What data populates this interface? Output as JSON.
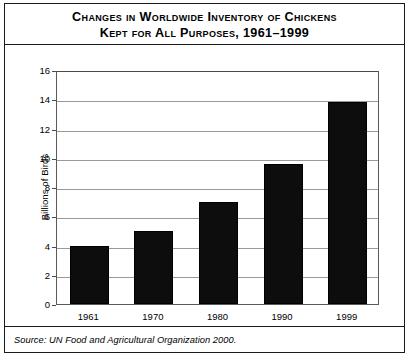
{
  "title": {
    "line1": "Changes in Worldwide Inventory of Chickens",
    "line2": "Kept for All Purposes, 1961–1999"
  },
  "source": {
    "text": "Source: UN Food and Agricultural Organization 2000."
  },
  "chart_data": {
    "type": "bar",
    "title": "Changes in Worldwide Inventory of Chickens Kept for All Purposes, 1961–1999",
    "categories": [
      "1961",
      "1970",
      "1980",
      "1990",
      "1999"
    ],
    "values": [
      4.0,
      5.0,
      7.0,
      9.6,
      13.8
    ],
    "xlabel": "",
    "ylabel": "Billions of Birds",
    "ylim": [
      0,
      16
    ],
    "ytick_labels": [
      "0",
      "2",
      "4",
      "6",
      "8",
      "10",
      "12",
      "14",
      "16"
    ],
    "ytick_values": [
      0,
      2,
      4,
      6,
      8,
      10,
      12,
      14,
      16
    ],
    "grid": true,
    "legend": false,
    "bar_color": "#0d0d0d",
    "grid_color": "#9a9a9a",
    "frame_color": "#5a5a5a"
  }
}
